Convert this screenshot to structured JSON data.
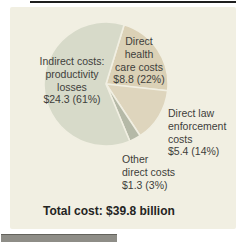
{
  "figure": {
    "background_color": "#f1efe2",
    "total_label": "Total cost: $39.8 billion",
    "text_color": "#3e3e3b"
  },
  "chart_data": {
    "type": "pie",
    "title": "",
    "units": "billions of dollars",
    "total_text": "Total cost: $39.8 billion",
    "total_value_billions": 39.8,
    "start_angle_deg": 17,
    "gap_color": "#f1efe2",
    "legend_position": "labels-on-chart",
    "slices": [
      {
        "name": "Direct health care costs",
        "value_billions": 8.8,
        "pct": 22,
        "color": "#dbd1b6",
        "label_lines": [
          "Direct",
          "health",
          "care costs",
          "$8.8 (22%)"
        ]
      },
      {
        "name": "Direct law enforcement costs",
        "value_billions": 5.4,
        "pct": 14,
        "color": "#ded5bd",
        "label_lines": [
          "Direct law",
          "enforcement",
          "costs",
          "$5.4 (14%)"
        ]
      },
      {
        "name": "Other direct costs",
        "value_billions": 1.3,
        "pct": 3,
        "color": "#b5b9a7",
        "label_lines": [
          "Other",
          "direct costs",
          "$1.3 (3%)"
        ]
      },
      {
        "name": "Indirect costs: productivity losses",
        "value_billions": 24.3,
        "pct": 61,
        "color": "#d7dac9",
        "label_lines": [
          "Indirect costs:",
          "productivity",
          "losses",
          "$24.3 (61%)"
        ]
      }
    ]
  }
}
